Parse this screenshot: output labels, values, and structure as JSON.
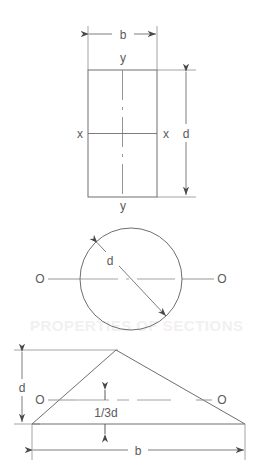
{
  "figure": {
    "background_color": "#ffffff",
    "line_color": "#6e6e6e",
    "text_color": "#5a5a5a",
    "width": 261,
    "height": 471
  },
  "sections": [
    {
      "name": "rectangle",
      "labels": {
        "width_dim": "b",
        "height_dim": "d",
        "axis_vertical_top": "y",
        "axis_vertical_bottom": "y",
        "axis_horizontal_left": "x",
        "axis_horizontal_right": "x"
      }
    },
    {
      "name": "circle",
      "labels": {
        "diameter_dim": "d",
        "axis_left": "O",
        "axis_right": "O"
      }
    },
    {
      "name": "triangle",
      "labels": {
        "height_dim": "d",
        "base_dim": "b",
        "centroid_height": "1/3d",
        "axis_left": "O",
        "axis_right": "O"
      }
    }
  ],
  "artifact": {
    "ghost_text": "reverse-side bleed-through"
  }
}
